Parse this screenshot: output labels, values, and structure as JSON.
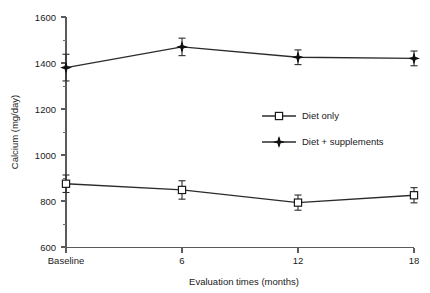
{
  "chart_data": {
    "type": "line",
    "title": "",
    "xlabel": "Evaluation times (months)",
    "ylabel": "Calcium (mg/day)",
    "categories": [
      "Baseline",
      "6",
      "12",
      "18"
    ],
    "x": [
      0,
      6,
      12,
      18
    ],
    "ylim": [
      600,
      1600
    ],
    "yticks": [
      600,
      800,
      1000,
      1200,
      1400,
      1600
    ],
    "ytick_labels": [
      "600",
      "800",
      "1000",
      "1200",
      "1400",
      "1600"
    ],
    "yticks_minor": [
      700,
      900,
      1100,
      1300,
      1500
    ],
    "xtick_labels": [
      "Baseline",
      "6",
      "12",
      "18"
    ],
    "grid": false,
    "legend_position": "center-right",
    "series": [
      {
        "name": "Diet only",
        "marker": "open-square",
        "values": [
          875,
          848,
          793,
          825
        ],
        "errors": [
          38,
          40,
          33,
          33
        ]
      },
      {
        "name": "Diet + supplements",
        "marker": "filled-star",
        "values": [
          1380,
          1470,
          1425,
          1420
        ],
        "errors": [
          58,
          38,
          32,
          32
        ]
      }
    ]
  },
  "legend": {
    "items": [
      {
        "label": "Diet only"
      },
      {
        "label": "Diet + supplements"
      }
    ]
  },
  "axes": {
    "y_title": "Calcium (mg/day)",
    "x_title": "Evaluation times (months)",
    "y_labels": [
      "1600",
      "1400",
      "1200",
      "1000",
      "800",
      "600"
    ],
    "x_labels": [
      "Baseline",
      "6",
      "12",
      "18"
    ]
  },
  "colors": {
    "line": "#2b2b2b",
    "axis": "#5b5b5b",
    "text": "#1a1a1a",
    "marker_fill_open": "#ffffff",
    "marker_fill_solid": "#111111",
    "background": "#ffffff"
  }
}
